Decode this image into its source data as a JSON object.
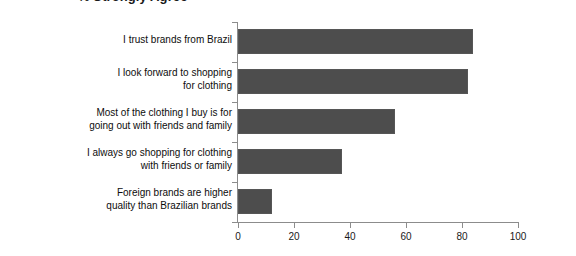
{
  "chart_data": {
    "type": "bar",
    "orientation": "horizontal",
    "title": "% Strongly Agree",
    "xlabel": "",
    "ylabel": "",
    "xlim": [
      0,
      100
    ],
    "xticks": [
      0,
      20,
      40,
      60,
      80,
      100
    ],
    "xtick_labels": [
      "0",
      "20",
      "40",
      "60",
      "80",
      "100"
    ],
    "grid": false,
    "legend": false,
    "bar_color": "#4d4d4d",
    "axis_color": "#8c8c8c",
    "categories": [
      "I trust brands from Brazil",
      "I look forward to shopping for clothing",
      "Most of the clothing I buy is for going out with friends and family",
      "I always go shopping for clothing with friends or family",
      "Foreign brands are higher quality than Brazilian brands"
    ],
    "category_lines": [
      [
        "I trust brands from Brazil"
      ],
      [
        "I look forward to shopping",
        "for clothing"
      ],
      [
        "Most of the clothing I buy is for",
        "going out with friends and family"
      ],
      [
        "I always go shopping for clothing",
        "with friends or family"
      ],
      [
        "Foreign brands are higher",
        "quality than Brazilian brands"
      ]
    ],
    "values": [
      84,
      82,
      56,
      37,
      12
    ]
  }
}
